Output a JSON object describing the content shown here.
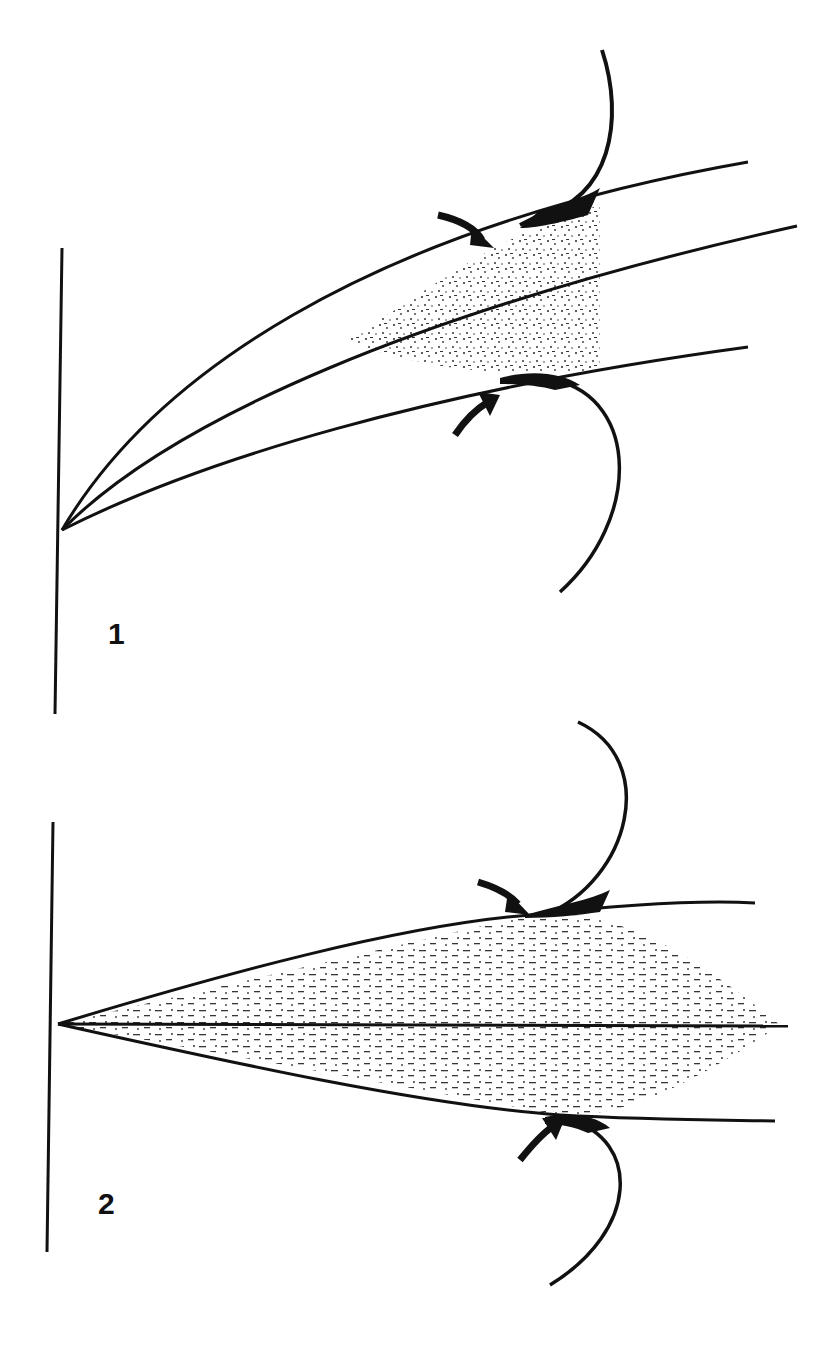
{
  "diagram": {
    "panels": [
      {
        "label": "1",
        "description": "Three curved diverging lines from a vertical wall with stippled interaction zone and curved arrows"
      },
      {
        "label": "2",
        "description": "Three straight diverging lines from a vertical wall with horizontal-dash textured wedge and curved arrows"
      }
    ],
    "colors": {
      "ink": "#111111",
      "background": "#ffffff"
    }
  }
}
